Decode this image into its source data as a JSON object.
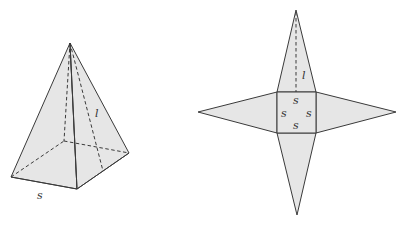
{
  "figure": {
    "colors": {
      "face_fill": "#e6e6e6",
      "stroke": "#3a3a3a",
      "label": "#333333"
    },
    "pyramid": {
      "description": "Square pyramid (3D view) with hidden edges dashed",
      "labels": {
        "slant_height": "l",
        "side": "s"
      }
    },
    "net": {
      "description": "Net of a square pyramid: square base with four triangular faces",
      "labels": {
        "slant_height": "l",
        "side_top": "s",
        "side_left": "s",
        "side_right": "s",
        "side_bottom": "s"
      }
    }
  }
}
